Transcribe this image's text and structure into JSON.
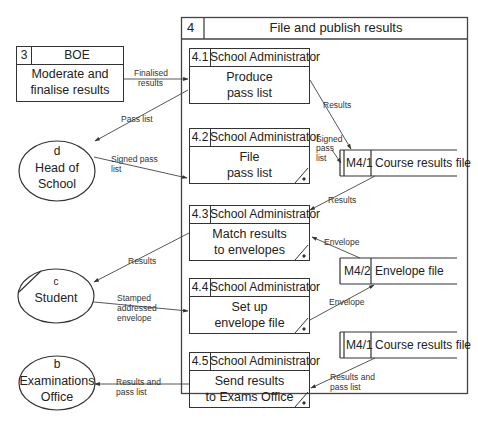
{
  "diagram": {
    "type": "data-flow-diagram",
    "parent_process": {
      "number": "4",
      "title": "File and publish results"
    },
    "external_process": {
      "number": "3",
      "actor": "BOE",
      "name_line1": "Moderate and",
      "name_line2": "finalise results"
    },
    "processes": [
      {
        "number": "4.1",
        "actor": "School Administrator",
        "name_line1": "Produce",
        "name_line2": "pass list",
        "duplicate_mark": false
      },
      {
        "number": "4.2",
        "actor": "School Administrator",
        "name_line1": "File",
        "name_line2": "pass list",
        "duplicate_mark": true
      },
      {
        "number": "4.3",
        "actor": "School Administrator",
        "name_line1": "Match results",
        "name_line2": "to envelopes",
        "duplicate_mark": true
      },
      {
        "number": "4.4",
        "actor": "School Administrator",
        "name_line1": "Set up",
        "name_line2": "envelope file",
        "duplicate_mark": true
      },
      {
        "number": "4.5",
        "actor": "School Administrator",
        "name_line1": "Send results",
        "name_line2": "to Exams Office",
        "duplicate_mark": true
      }
    ],
    "external_entities": [
      {
        "id": "d",
        "name_line1": "Head of",
        "name_line2": "School"
      },
      {
        "id": "c",
        "name_line1": "Student",
        "name_line2": ""
      },
      {
        "id": "b",
        "name_line1": "Examinations",
        "name_line2": "Office"
      }
    ],
    "data_stores": [
      {
        "id": "M4/1",
        "name": "Course results file"
      },
      {
        "id": "M4/2",
        "name": "Envelope file"
      },
      {
        "id": "M4/1",
        "name": "Course results file"
      }
    ],
    "flows": [
      {
        "from": "3",
        "to": "4.1",
        "label_line1": "Finalised",
        "label_line2": "results"
      },
      {
        "from": "4.1",
        "to": "d",
        "label_line1": "Pass list",
        "label_line2": ""
      },
      {
        "from": "4.1",
        "to": "M4/1",
        "label_line1": "Results",
        "label_line2": ""
      },
      {
        "from": "d",
        "to": "4.2",
        "label_line1": "Signed pass",
        "label_line2": "list"
      },
      {
        "from": "4.2",
        "to": "M4/1",
        "label_line1": "Signed",
        "label_line2": "pass",
        "label_line3": "list"
      },
      {
        "from": "M4/1",
        "to": "4.3",
        "label_line1": "Results",
        "label_line2": ""
      },
      {
        "from": "M4/2",
        "to": "4.3",
        "label_line1": "Envelope",
        "label_line2": ""
      },
      {
        "from": "4.3",
        "to": "c",
        "label_line1": "Results",
        "label_line2": ""
      },
      {
        "from": "c",
        "to": "4.4",
        "label_line1": "Stamped",
        "label_line2": "addressed",
        "label_line3": "envelope"
      },
      {
        "from": "4.4",
        "to": "M4/2",
        "label_line1": "Envelope",
        "label_line2": ""
      },
      {
        "from": "M4/1",
        "to": "4.5",
        "label_line1": "Results and",
        "label_line2": "pass list"
      },
      {
        "from": "4.5",
        "to": "b",
        "label_line1": "Results and",
        "label_line2": "pass list"
      }
    ]
  }
}
